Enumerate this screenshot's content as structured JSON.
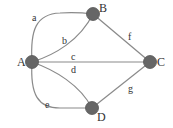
{
  "diagram": {
    "type": "graph",
    "nodes": [
      {
        "id": "A",
        "label": "A",
        "x": 32,
        "y": 62
      },
      {
        "id": "B",
        "label": "B",
        "x": 93,
        "y": 14
      },
      {
        "id": "C",
        "label": "C",
        "x": 150,
        "y": 62
      },
      {
        "id": "D",
        "label": "D",
        "x": 92,
        "y": 108
      }
    ],
    "edges": [
      {
        "id": "a",
        "label": "a",
        "from": "A",
        "to": "B"
      },
      {
        "id": "b",
        "label": "b",
        "from": "A",
        "to": "B"
      },
      {
        "id": "c",
        "label": "c",
        "from": "A",
        "to": "C"
      },
      {
        "id": "d",
        "label": "d",
        "from": "A",
        "to": "C"
      },
      {
        "id": "e",
        "label": "e",
        "from": "A",
        "to": "D"
      },
      {
        "id": "f",
        "label": "f",
        "from": "B",
        "to": "C"
      },
      {
        "id": "g",
        "label": "g",
        "from": "D",
        "to": "C"
      }
    ],
    "colors": {
      "node_fill": "#666666",
      "edge_stroke": "#8a8a8a",
      "text": "#333333"
    }
  }
}
